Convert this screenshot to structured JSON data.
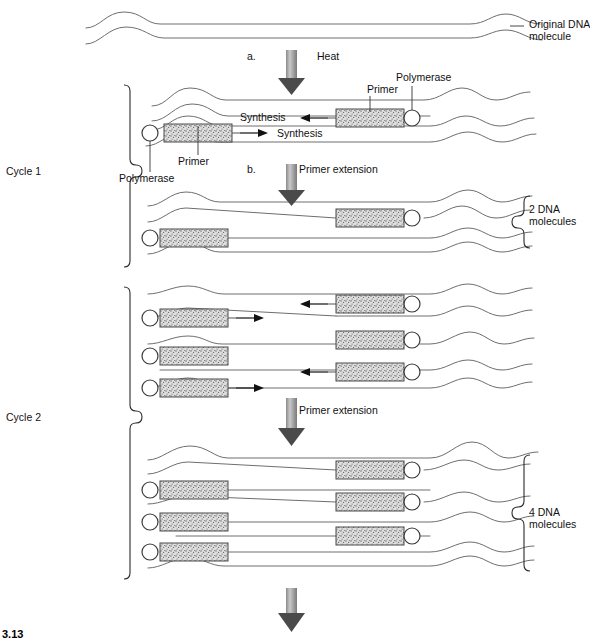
{
  "figure": {
    "caption_number": "3.13",
    "type": "process-diagram"
  },
  "labels": {
    "original_dna_line1": "Original DNA",
    "original_dna_line2": "molecule",
    "step_a": "a.",
    "step_a_action": "Heat",
    "step_b": "b.",
    "step_b_action": "Primer extension",
    "synthesis_upper": "Synthesis",
    "synthesis_lower": "Synthesis",
    "primer_upper": "Primer",
    "primer_lower": "Primer",
    "polymerase_upper": "Polymerase",
    "polymerase_lower": "Polymerase",
    "cycle_1": "Cycle 1",
    "cycle_2": "Cycle 2",
    "primer_extension_cycle2": "Primer extension",
    "product_2_line1": "2 DNA",
    "product_2_line2": "molecules",
    "product_4_line1": "4 DNA",
    "product_4_line2": "molecules"
  },
  "colors": {
    "stroke": "#6e6e6e",
    "stroke_dark": "#3a3a3a",
    "primer_fill": "#dcdcdc",
    "primer_stipple": "#5a5a5a",
    "arrow_light": "#cfcfcf",
    "arrow_dark": "#4a4a4a",
    "text": "#111111",
    "background": "#ffffff"
  },
  "icons": {
    "polymerase": "circle-icon",
    "primer": "stippled-rectangle-icon",
    "heat_arrow": "down-arrow-icon",
    "extension_arrow": "down-arrow-icon",
    "synthesis_direction_left": "left-arrow-icon",
    "synthesis_direction_right": "right-arrow-icon",
    "cycle_brace": "curly-brace-icon",
    "product_brace": "curly-brace-icon"
  },
  "structure": {
    "original_molecule": {
      "strands": 2,
      "description": "double-stranded wavy DNA"
    },
    "cycle_1": {
      "name": "Cycle 1",
      "steps": [
        {
          "key": "a",
          "action": "Heat",
          "result": "strand separation / denaturation"
        },
        {
          "key": "b",
          "action": "Primer extension",
          "result": "2 DNA molecules"
        }
      ],
      "primers": 2,
      "polymerases": 2,
      "product_count": 2
    },
    "cycle_2": {
      "name": "Cycle 2",
      "steps": [
        {
          "key": "",
          "action": "Primer extension",
          "result": "4 DNA molecules"
        }
      ],
      "primers": 4,
      "polymerases": 4,
      "product_count": 4
    }
  }
}
